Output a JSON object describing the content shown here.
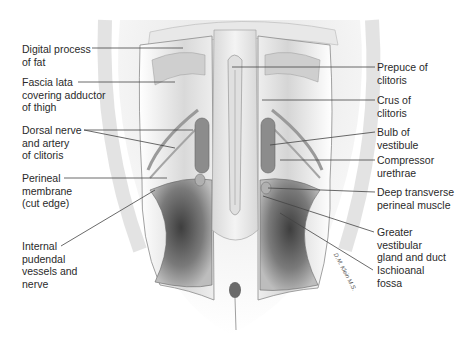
{
  "figure": {
    "style": "grayscale pencil illustration",
    "colors": {
      "background": "#ffffff",
      "skin": "#e6e6e6",
      "muscle": "#b8b8b8",
      "fossa": "#5a5a5a",
      "leader_line": "#444444",
      "text": "#2a2a2a"
    }
  },
  "labels_left": [
    {
      "id": "digital-process",
      "lines": [
        "Digital process",
        "of fat"
      ]
    },
    {
      "id": "fascia-lata",
      "lines": [
        "Fascia lata",
        "covering adductor",
        "of thigh"
      ]
    },
    {
      "id": "dorsal-nerve",
      "lines": [
        "Dorsal nerve",
        "and artery",
        "of clitoris"
      ]
    },
    {
      "id": "perineal-membrane",
      "lines": [
        "Perineal",
        "membrane",
        "(cut edge)"
      ]
    },
    {
      "id": "internal-pudendal",
      "lines": [
        "Internal",
        "pudendal",
        "vessels and",
        "nerve"
      ]
    }
  ],
  "labels_right": [
    {
      "id": "prepuce",
      "lines": [
        "Prepuce of",
        "clitoris"
      ]
    },
    {
      "id": "crus",
      "lines": [
        "Crus of",
        "clitoris"
      ]
    },
    {
      "id": "bulb",
      "lines": [
        "Bulb of",
        "vestibule"
      ]
    },
    {
      "id": "compressor",
      "lines": [
        "Compressor",
        "urethrae"
      ]
    },
    {
      "id": "deep-transverse",
      "lines": [
        "Deep transverse",
        "perineal muscle"
      ]
    },
    {
      "id": "greater-vestibular",
      "lines": [
        "Greater",
        "vestibular",
        "gland and duct"
      ]
    },
    {
      "id": "ischioanal",
      "lines": [
        "Ischioanal",
        "fossa"
      ]
    }
  ],
  "signature": "D.M. Klein M.S."
}
